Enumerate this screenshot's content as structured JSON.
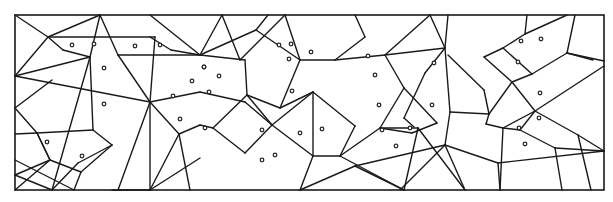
{
  "diagram": {
    "type": "planar-subdivision-with-sites",
    "width": 613,
    "height": 202,
    "frame": {
      "x": 15,
      "y": 15,
      "w": 589,
      "h": 175
    },
    "colors": {
      "line": "#1a1a1a",
      "background": "#ffffff",
      "site_fill": "#ffffff",
      "site_stroke": "#2a2a2a"
    },
    "segments": [
      [
        15,
        15,
        48,
        37
      ],
      [
        48,
        37,
        100,
        15
      ],
      [
        48,
        37,
        63,
        50
      ],
      [
        63,
        50,
        90,
        57
      ],
      [
        90,
        57,
        100,
        15
      ],
      [
        48,
        37,
        155,
        37
      ],
      [
        48,
        37,
        15,
        76
      ],
      [
        15,
        76,
        90,
        57
      ],
      [
        90,
        57,
        93,
        130
      ],
      [
        90,
        57,
        52,
        190
      ],
      [
        15,
        76,
        150,
        102
      ],
      [
        15,
        108,
        52,
        80
      ],
      [
        15,
        108,
        37,
        133
      ],
      [
        37,
        133,
        93,
        130
      ],
      [
        93,
        130,
        112,
        145
      ],
      [
        112,
        145,
        78,
        163
      ],
      [
        78,
        163,
        52,
        190
      ],
      [
        37,
        133,
        50,
        160
      ],
      [
        50,
        160,
        15,
        175
      ],
      [
        50,
        160,
        81,
        172
      ],
      [
        81,
        172,
        74,
        190
      ],
      [
        37,
        133,
        50,
        160
      ],
      [
        15,
        160,
        74,
        190
      ],
      [
        15,
        190,
        50,
        160
      ],
      [
        15,
        134,
        37,
        133
      ],
      [
        81,
        172,
        112,
        145
      ],
      [
        100,
        15,
        118,
        55
      ],
      [
        118,
        55,
        150,
        102
      ],
      [
        155,
        37,
        150,
        102
      ],
      [
        150,
        102,
        118,
        190
      ],
      [
        118,
        55,
        200,
        55
      ],
      [
        150,
        37,
        171,
        50
      ],
      [
        171,
        50,
        200,
        55
      ],
      [
        150,
        15,
        200,
        55
      ],
      [
        150,
        102,
        200,
        92
      ],
      [
        150,
        102,
        179,
        134
      ],
      [
        179,
        134,
        150,
        190
      ],
      [
        150,
        102,
        150,
        190
      ],
      [
        179,
        134,
        200,
        125
      ],
      [
        179,
        134,
        190,
        190
      ],
      [
        150,
        190,
        200,
        158
      ],
      [
        200,
        55,
        222,
        15
      ],
      [
        200,
        55,
        256,
        30
      ],
      [
        256,
        30,
        268,
        15
      ],
      [
        256,
        30,
        300,
        60
      ],
      [
        300,
        60,
        285,
        15
      ],
      [
        200,
        55,
        245,
        60
      ],
      [
        245,
        60,
        247,
        95
      ],
      [
        247,
        95,
        213,
        128
      ],
      [
        213,
        128,
        200,
        125
      ],
      [
        247,
        95,
        272,
        125
      ],
      [
        272,
        125,
        245,
        153
      ],
      [
        245,
        153,
        213,
        128
      ],
      [
        247,
        95,
        280,
        108
      ],
      [
        280,
        108,
        313,
        92
      ],
      [
        300,
        60,
        280,
        108
      ],
      [
        300,
        60,
        335,
        60
      ],
      [
        335,
        60,
        365,
        37
      ],
      [
        365,
        37,
        355,
        15
      ],
      [
        335,
        60,
        385,
        55
      ],
      [
        385,
        55,
        430,
        15
      ],
      [
        385,
        55,
        404,
        88
      ],
      [
        404,
        88,
        380,
        128
      ],
      [
        380,
        128,
        412,
        133
      ],
      [
        412,
        133,
        437,
        123
      ],
      [
        437,
        123,
        404,
        88
      ],
      [
        385,
        55,
        445,
        48
      ],
      [
        445,
        48,
        430,
        15
      ],
      [
        445,
        48,
        448,
        15
      ],
      [
        445,
        48,
        425,
        73
      ],
      [
        425,
        73,
        404,
        118
      ],
      [
        404,
        118,
        414,
        127
      ],
      [
        313,
        92,
        355,
        126
      ],
      [
        355,
        126,
        340,
        156
      ],
      [
        340,
        156,
        380,
        128
      ],
      [
        272,
        125,
        313,
        92
      ],
      [
        313,
        92,
        313,
        156
      ],
      [
        313,
        156,
        272,
        125
      ],
      [
        313,
        156,
        300,
        190
      ],
      [
        313,
        156,
        340,
        156
      ],
      [
        340,
        156,
        404,
        190
      ],
      [
        404,
        190,
        418,
        128
      ],
      [
        300,
        190,
        355,
        166
      ],
      [
        355,
        166,
        404,
        190
      ],
      [
        355,
        166,
        445,
        145
      ],
      [
        445,
        145,
        450,
        112
      ],
      [
        450,
        112,
        445,
        48
      ],
      [
        450,
        112,
        489,
        114
      ],
      [
        489,
        114,
        484,
        90
      ],
      [
        484,
        90,
        448,
        55
      ],
      [
        489,
        114,
        512,
        82
      ],
      [
        512,
        82,
        484,
        57
      ],
      [
        484,
        57,
        503,
        48
      ],
      [
        503,
        48,
        525,
        34
      ],
      [
        525,
        34,
        527,
        15
      ],
      [
        503,
        48,
        532,
        74
      ],
      [
        532,
        74,
        512,
        82
      ],
      [
        532,
        74,
        567,
        53
      ],
      [
        567,
        53,
        604,
        61
      ],
      [
        567,
        53,
        575,
        15
      ],
      [
        525,
        34,
        567,
        15
      ],
      [
        567,
        53,
        593,
        60
      ],
      [
        489,
        114,
        486,
        124
      ],
      [
        486,
        124,
        503,
        128
      ],
      [
        503,
        128,
        535,
        111
      ],
      [
        535,
        111,
        512,
        82
      ],
      [
        535,
        111,
        520,
        130
      ],
      [
        520,
        130,
        555,
        148
      ],
      [
        555,
        148,
        604,
        151
      ],
      [
        555,
        148,
        562,
        190
      ],
      [
        520,
        130,
        503,
        128
      ],
      [
        503,
        128,
        500,
        190
      ],
      [
        535,
        111,
        604,
        66
      ],
      [
        535,
        111,
        578,
        135
      ],
      [
        578,
        135,
        604,
        151
      ],
      [
        578,
        135,
        591,
        190
      ],
      [
        445,
        145,
        498,
        163
      ],
      [
        498,
        163,
        500,
        190
      ],
      [
        498,
        163,
        604,
        151
      ],
      [
        445,
        145,
        465,
        190
      ],
      [
        445,
        145,
        400,
        190
      ],
      [
        418,
        128,
        465,
        190
      ],
      [
        418,
        128,
        380,
        128
      ],
      [
        200,
        92,
        245,
        102
      ],
      [
        245,
        102,
        272,
        125
      ],
      [
        222,
        15,
        240,
        60
      ],
      [
        240,
        60,
        285,
        15
      ],
      [
        15,
        175,
        52,
        190
      ],
      [
        150,
        190,
        112,
        190
      ]
    ],
    "sites": [
      [
        72,
        45
      ],
      [
        94,
        44
      ],
      [
        104,
        68
      ],
      [
        104,
        104
      ],
      [
        135,
        46
      ],
      [
        160,
        45
      ],
      [
        192,
        81
      ],
      [
        204,
        67
      ],
      [
        219,
        76
      ],
      [
        209,
        92
      ],
      [
        173,
        96
      ],
      [
        180,
        119
      ],
      [
        205,
        128
      ],
      [
        204,
        67
      ],
      [
        262,
        160
      ],
      [
        275,
        155
      ],
      [
        300,
        133
      ],
      [
        322,
        129
      ],
      [
        279,
        45
      ],
      [
        291,
        44
      ],
      [
        311,
        52
      ],
      [
        289,
        59
      ],
      [
        292,
        91
      ],
      [
        262,
        130
      ],
      [
        368,
        56
      ],
      [
        375,
        75
      ],
      [
        379,
        105
      ],
      [
        382,
        130
      ],
      [
        410,
        128
      ],
      [
        396,
        146
      ],
      [
        434,
        63
      ],
      [
        432,
        105
      ],
      [
        521,
        41
      ],
      [
        541,
        39
      ],
      [
        518,
        62
      ],
      [
        540,
        93
      ],
      [
        539,
        118
      ],
      [
        519,
        128
      ],
      [
        525,
        144
      ],
      [
        47,
        142
      ],
      [
        82,
        156
      ]
    ]
  }
}
